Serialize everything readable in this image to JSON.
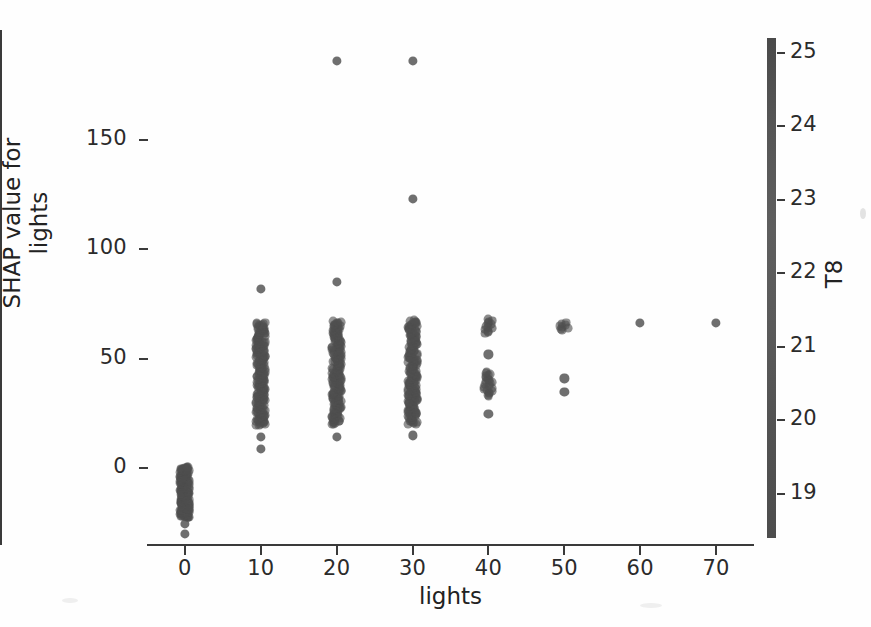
{
  "figure": {
    "kind": "shap-dependence-scatter",
    "background_color": "#fefefe",
    "point_color": "#4f4f4f",
    "axis_color": "#3a3a3a"
  },
  "chart_data": {
    "type": "scatter",
    "title": "",
    "xlabel": "lights",
    "ylabel": "SHAP value for\nlights",
    "ylabel_line1": "SHAP value for",
    "ylabel_line2": "lights",
    "xlim": [
      -5,
      75
    ],
    "ylim": [
      -35,
      200
    ],
    "xticks": [
      0,
      10,
      20,
      30,
      40,
      50,
      60,
      70
    ],
    "xticklabels": [
      "0",
      "10",
      "20",
      "30",
      "40",
      "50",
      "60",
      "70"
    ],
    "yticks": [
      0,
      50,
      100,
      150
    ],
    "yticklabels": [
      "0",
      "50",
      "100",
      "150"
    ],
    "grid": false,
    "legend": null,
    "colorbar": {
      "label": "T8",
      "ticks": [
        19,
        20,
        21,
        22,
        23,
        24,
        25
      ],
      "ticklabels": [
        "19",
        "20",
        "21",
        "22",
        "23",
        "24",
        "25"
      ],
      "vmin": 18.4,
      "vmax": 25.2,
      "colormap": "grayscale"
    },
    "series": [
      {
        "name": "lights = 0",
        "x_value": 0,
        "dense_band": [
          -22.5,
          0.5
        ],
        "dense_count": 220,
        "outliers": [
          -25.5,
          -30.0
        ]
      },
      {
        "name": "lights = 10",
        "x_value": 10,
        "dense_band": [
          19.5,
          66.5
        ],
        "dense_count": 180,
        "outliers": [
          82.0,
          14.5,
          9.0
        ]
      },
      {
        "name": "lights = 20",
        "x_value": 20,
        "dense_band": [
          20.0,
          67.0
        ],
        "dense_count": 170,
        "outliers": [
          186.0,
          85.0,
          14.5
        ]
      },
      {
        "name": "lights = 30",
        "x_value": 30,
        "dense_band": [
          20.0,
          67.5
        ],
        "dense_count": 170,
        "outliers": [
          186.0,
          123.0,
          15.0
        ]
      },
      {
        "name": "lights = 40",
        "x_value": 40,
        "dense_band": [
          33.0,
          44.0
        ],
        "dense_count": 22,
        "upper_band": [
          61.5,
          68.0
        ],
        "upper_count": 12,
        "outliers": [
          52.0,
          25.0
        ]
      },
      {
        "name": "lights = 50",
        "x_value": 50,
        "dense_band": [
          63.0,
          66.5
        ],
        "dense_count": 8,
        "outliers": [
          41.0,
          35.0
        ]
      },
      {
        "name": "lights = 60",
        "x_value": 60,
        "dense_band": null,
        "points": [
          66.5
        ]
      },
      {
        "name": "lights = 70",
        "x_value": 70,
        "dense_band": null,
        "points": [
          66.5
        ]
      }
    ]
  }
}
